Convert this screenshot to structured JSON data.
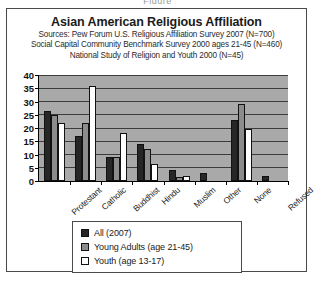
{
  "figure_caption": "Figure",
  "chart_data": {
    "type": "bar",
    "title": "Asian American Religious Affiliation",
    "subtitle_lines": [
      "Sources: Pew Forum U.S. Religious Affiliation Survey 2007 (N=700)",
      "Social Capital Community Benchmark Survey 2000 ages 21-45 (N=460)",
      "National Study of Religion and Youth 2000 (N=45)"
    ],
    "xlabel": "",
    "ylabel": "",
    "ylim": [
      0,
      40
    ],
    "yticks": [
      0,
      5,
      10,
      15,
      20,
      25,
      30,
      35,
      40
    ],
    "grid": true,
    "legend_position": "bottom",
    "categories": [
      "Protestant",
      "Catholic",
      "Buddhist",
      "Hindu",
      "Muslim",
      "Other",
      "None",
      "Refused"
    ],
    "series": [
      {
        "name": "All (2007)",
        "color": "#262626",
        "values": [
          26.5,
          17,
          9,
          14,
          4,
          3,
          23,
          2
        ]
      },
      {
        "name": "Young Adults (age 21-45)",
        "color": "#8c8c8c",
        "values": [
          25,
          22,
          9,
          12,
          1.5,
          0,
          29,
          0
        ]
      },
      {
        "name": "Youth (age 13-17)",
        "color": "#ffffff",
        "values": [
          22,
          36,
          18,
          6.5,
          2,
          0,
          19.5,
          0
        ]
      }
    ]
  }
}
